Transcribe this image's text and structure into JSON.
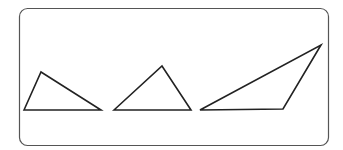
{
  "diagram": {
    "frame": {
      "x": 19.5,
      "y": 8.5,
      "width": 309,
      "height": 137,
      "radius": 8,
      "stroke": "#555555",
      "stroke_width": 1.2
    },
    "line_color": "#222222",
    "line_width": 1.6,
    "triangles": [
      {
        "name": "triangle-1",
        "points": "24,110 41,72 101,110"
      },
      {
        "name": "triangle-2",
        "points": "114,110 162,66 191,110"
      },
      {
        "name": "triangle-3",
        "points": "200,110 321,45 283,109"
      }
    ]
  }
}
